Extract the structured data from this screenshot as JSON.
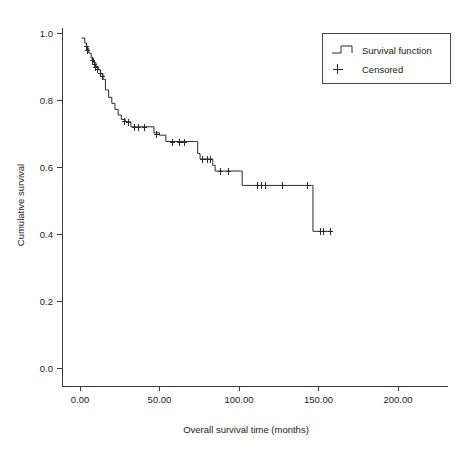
{
  "chart_data": {
    "type": "line",
    "subtype": "kaplan-meier-step",
    "title": "",
    "xlabel": "Overall survival time (months)",
    "ylabel": "Cumulative survival",
    "xlim": [
      0,
      210
    ],
    "ylim": [
      0.0,
      1.05
    ],
    "grid": false,
    "xticks": [
      0,
      50,
      100,
      150,
      200
    ],
    "xticklabels": [
      "0.00",
      "50.00",
      "100.00",
      "150.00",
      "200.00"
    ],
    "yticks": [
      0.0,
      0.2,
      0.4,
      0.6,
      0.8,
      1.0
    ],
    "yticklabels": [
      "0.0",
      "0.2",
      "0.4",
      "0.6",
      "0.8",
      "1.0"
    ],
    "legend": {
      "position": "top-right",
      "entries": [
        {
          "label": "Survival function",
          "marker": "step-line"
        },
        {
          "label": "Censored",
          "marker": "plus"
        }
      ]
    },
    "series": [
      {
        "name": "Survival function",
        "step": "post",
        "points": [
          {
            "t": 1.0,
            "s": 0.985
          },
          {
            "t": 3.0,
            "s": 0.97
          },
          {
            "t": 4.2,
            "s": 0.955
          },
          {
            "t": 5.5,
            "s": 0.94
          },
          {
            "t": 7.0,
            "s": 0.925
          },
          {
            "t": 8.5,
            "s": 0.912
          },
          {
            "t": 10.0,
            "s": 0.9
          },
          {
            "t": 11.5,
            "s": 0.89
          },
          {
            "t": 13.0,
            "s": 0.878
          },
          {
            "t": 14.5,
            "s": 0.862
          },
          {
            "t": 16.0,
            "s": 0.83
          },
          {
            "t": 18.0,
            "s": 0.808
          },
          {
            "t": 20.0,
            "s": 0.79
          },
          {
            "t": 22.0,
            "s": 0.772
          },
          {
            "t": 24.0,
            "s": 0.755
          },
          {
            "t": 26.0,
            "s": 0.742
          },
          {
            "t": 28.5,
            "s": 0.735
          },
          {
            "t": 32.0,
            "s": 0.72
          },
          {
            "t": 44.0,
            "s": 0.72
          },
          {
            "t": 46.5,
            "s": 0.702
          },
          {
            "t": 50.0,
            "s": 0.695
          },
          {
            "t": 54.0,
            "s": 0.676
          },
          {
            "t": 72.0,
            "s": 0.676
          },
          {
            "t": 74.0,
            "s": 0.64
          },
          {
            "t": 75.5,
            "s": 0.624
          },
          {
            "t": 82.5,
            "s": 0.624
          },
          {
            "t": 83.5,
            "s": 0.605
          },
          {
            "t": 85.0,
            "s": 0.588
          },
          {
            "t": 101.0,
            "s": 0.588
          },
          {
            "t": 102.0,
            "s": 0.545
          },
          {
            "t": 145.5,
            "s": 0.545
          },
          {
            "t": 146.5,
            "s": 0.408
          },
          {
            "t": 158.0,
            "s": 0.408
          }
        ]
      }
    ],
    "censored": [
      {
        "t": 3.5,
        "s": 0.962
      },
      {
        "t": 4.5,
        "s": 0.948
      },
      {
        "t": 7.5,
        "s": 0.92
      },
      {
        "t": 8.8,
        "s": 0.908
      },
      {
        "t": 9.6,
        "s": 0.9
      },
      {
        "t": 11.0,
        "s": 0.892
      },
      {
        "t": 12.5,
        "s": 0.88
      },
      {
        "t": 13.8,
        "s": 0.872
      },
      {
        "t": 27.5,
        "s": 0.738
      },
      {
        "t": 30.0,
        "s": 0.735
      },
      {
        "t": 34.0,
        "s": 0.72
      },
      {
        "t": 36.5,
        "s": 0.72
      },
      {
        "t": 40.0,
        "s": 0.72
      },
      {
        "t": 48.0,
        "s": 0.698
      },
      {
        "t": 58.0,
        "s": 0.676
      },
      {
        "t": 62.5,
        "s": 0.676
      },
      {
        "t": 65.5,
        "s": 0.676
      },
      {
        "t": 77.0,
        "s": 0.624
      },
      {
        "t": 80.0,
        "s": 0.624
      },
      {
        "t": 81.5,
        "s": 0.624
      },
      {
        "t": 88.0,
        "s": 0.588
      },
      {
        "t": 93.0,
        "s": 0.588
      },
      {
        "t": 111.5,
        "s": 0.545
      },
      {
        "t": 114.0,
        "s": 0.545
      },
      {
        "t": 116.5,
        "s": 0.545
      },
      {
        "t": 127.0,
        "s": 0.545
      },
      {
        "t": 143.0,
        "s": 0.545
      },
      {
        "t": 151.0,
        "s": 0.408
      },
      {
        "t": 153.0,
        "s": 0.408
      },
      {
        "t": 157.0,
        "s": 0.408
      }
    ]
  }
}
